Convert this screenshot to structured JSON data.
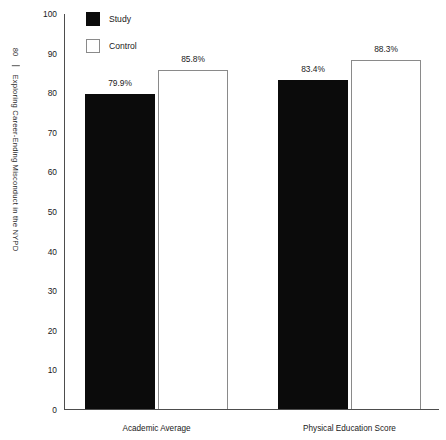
{
  "page": {
    "running_head_number": "80",
    "running_head_title": "Exploring Career-Ending Misconduct in the NYPD"
  },
  "legend": {
    "position": "top-left-inside",
    "entries": [
      {
        "label": "Study",
        "color": "#0b0b0b",
        "style": "filled"
      },
      {
        "label": "Control",
        "color": "#ffffff",
        "style": "outlined"
      }
    ]
  },
  "chart_data": {
    "type": "bar",
    "title": "",
    "subtitle": "",
    "xlabel": "",
    "ylabel": "",
    "ylim": [
      0,
      100
    ],
    "yticks": [
      0,
      10,
      20,
      30,
      40,
      50,
      60,
      70,
      80,
      90,
      100
    ],
    "ytick_labels": [
      "0",
      "10",
      "20",
      "30",
      "40",
      "50",
      "60",
      "70",
      "80",
      "90",
      "100"
    ],
    "grid": false,
    "legend_position": "top-left",
    "categories": [
      "Academic Average",
      "Physical Education Score"
    ],
    "series": [
      {
        "name": "Study",
        "color": "#0b0b0b",
        "values": [
          79.9,
          83.4
        ],
        "data_labels": [
          "79.9%",
          "83.4%"
        ]
      },
      {
        "name": "Control",
        "color": "#ffffff",
        "values": [
          85.8,
          88.3
        ],
        "data_labels": [
          "85.8%",
          "88.3%"
        ]
      }
    ]
  }
}
